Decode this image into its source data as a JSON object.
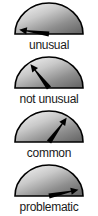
{
  "figure": {
    "kind": "gauge-dial-series",
    "background_color": "#ffffff",
    "dial_fill_light": "#e8e8e8",
    "dial_fill_dark": "#6e6e6e",
    "dial_outline_color": "#000000",
    "needle_color": "#000000",
    "label_color": "#1a1a1a"
  },
  "chart_data": {
    "type": "gauge",
    "title": "",
    "xlabel": "",
    "ylabel": "",
    "axis_range_degrees": [
      0,
      180
    ],
    "legend_position": "below-each",
    "grid": false,
    "categories": [
      "unusual",
      "not unusual",
      "common",
      "problematic"
    ],
    "values": [
      172,
      128,
      54,
      12
    ],
    "series": [
      {
        "name": "needle angle (degrees from right horizontal, CCW)",
        "values": [
          172,
          128,
          54,
          12
        ]
      }
    ],
    "annotations": [
      "unusual",
      "not unusual",
      "common",
      "problematic"
    ]
  },
  "gauges": [
    {
      "label": "unusual",
      "needle_angle": 172,
      "needle_length": 30,
      "icon": "gauge-needle-icon"
    },
    {
      "label": "not unusual",
      "needle_angle": 128,
      "needle_length": 30,
      "icon": "gauge-needle-icon"
    },
    {
      "label": "common",
      "needle_angle": 54,
      "needle_length": 30,
      "icon": "gauge-needle-icon"
    },
    {
      "label": "problematic",
      "needle_angle": 12,
      "needle_length": 30,
      "icon": "gauge-needle-icon"
    }
  ]
}
